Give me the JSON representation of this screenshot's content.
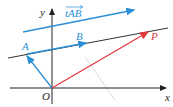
{
  "diagram": {
    "labels": {
      "y_axis": "y",
      "x_axis": "x",
      "origin": "O",
      "point_a": "A",
      "point_b": "B",
      "point_p": "P",
      "vector_tab": "tAB"
    },
    "colors": {
      "axis": "#222222",
      "blue": "#2b8fd6",
      "red": "#e0393e",
      "line": "#333333",
      "faint": "#cfcfcf"
    }
  }
}
